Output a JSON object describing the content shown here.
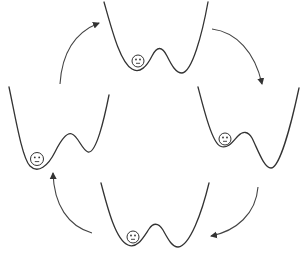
{
  "diagram": {
    "type": "cyclic-transition",
    "colors": {
      "stroke": "#333333",
      "arrow": "#444444",
      "background": "#ffffff"
    },
    "states": [
      {
        "id": "top",
        "label": "Particle in left well (shallow barrier, wells near-equal)",
        "particle_well": "left"
      },
      {
        "id": "right",
        "label": "Particle in left (metastable) well, right well deeper",
        "particle_well": "left"
      },
      {
        "id": "bottom",
        "label": "Particle in left well (wells near-equal)",
        "particle_well": "left"
      },
      {
        "id": "left",
        "label": "Particle in left well (deeper), right well shallower",
        "particle_well": "left"
      }
    ],
    "arrows": [
      {
        "from": "left",
        "to": "top",
        "direction": "clockwise"
      },
      {
        "from": "top",
        "to": "right",
        "direction": "clockwise"
      },
      {
        "from": "right",
        "to": "bottom",
        "direction": "clockwise"
      },
      {
        "from": "bottom",
        "to": "left",
        "direction": "clockwise"
      }
    ],
    "particle_icon": "smiley-face-icon"
  }
}
